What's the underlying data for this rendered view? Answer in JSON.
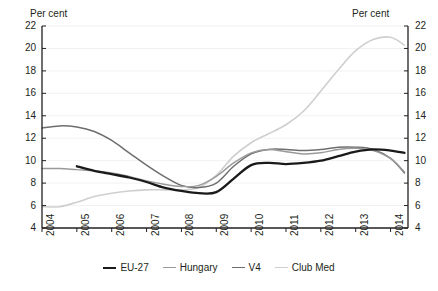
{
  "chart_data": {
    "type": "line",
    "title": "",
    "xlabel": "",
    "ylabel": "Per cent",
    "ylabel_right": "Per cent",
    "ylim": [
      4,
      22
    ],
    "yticks": [
      4,
      6,
      8,
      10,
      12,
      14,
      16,
      18,
      20,
      22
    ],
    "ytick_labels": [
      "4",
      "6",
      "8",
      "10",
      "12",
      "14",
      "16",
      "18",
      "20",
      "22"
    ],
    "xlim": [
      2004,
      2014.5
    ],
    "xticks": [
      2004,
      2005,
      2006,
      2007,
      2008,
      2009,
      2010,
      2011,
      2012,
      2013,
      2014
    ],
    "xtick_labels": [
      "2004",
      "2005",
      "2006",
      "2007",
      "2008",
      "2009",
      "2010",
      "2011",
      "2012",
      "2013",
      "2014"
    ],
    "grid": true,
    "grid_color": "#f2f2f2",
    "legend_position": "bottom",
    "series": [
      {
        "name": "EU-27",
        "color": "#1a1a1a",
        "width": 2.3,
        "x": [
          2005.0,
          2005.5,
          2006.0,
          2006.5,
          2007.0,
          2007.5,
          2008.0,
          2008.5,
          2009.0,
          2009.5,
          2010.0,
          2010.5,
          2011.0,
          2011.5,
          2012.0,
          2012.5,
          2013.0,
          2013.5,
          2014.0,
          2014.4
        ],
        "values": [
          9.5,
          9.1,
          8.8,
          8.5,
          8.1,
          7.6,
          7.3,
          7.1,
          7.2,
          8.4,
          9.6,
          9.8,
          9.7,
          9.8,
          10.0,
          10.4,
          10.8,
          11.0,
          10.9,
          10.7
        ]
      },
      {
        "name": "Hungary",
        "color": "#9a9a9a",
        "width": 1.4,
        "x": [
          2004.0,
          2004.5,
          2005.0,
          2005.5,
          2006.0,
          2006.5,
          2007.0,
          2007.5,
          2008.0,
          2008.5,
          2009.0,
          2009.5,
          2010.0,
          2010.5,
          2011.0,
          2011.5,
          2012.0,
          2012.5,
          2013.0,
          2013.5,
          2014.0,
          2014.4
        ],
        "values": [
          9.3,
          9.3,
          9.2,
          9.1,
          8.9,
          8.6,
          8.2,
          7.9,
          7.7,
          7.8,
          8.6,
          9.8,
          10.7,
          11.0,
          10.8,
          10.6,
          10.7,
          11.0,
          11.1,
          10.9,
          10.2,
          9.0
        ]
      },
      {
        "name": "V4",
        "color": "#6e6e6e",
        "width": 1.5,
        "x": [
          2004.0,
          2004.5,
          2005.0,
          2005.5,
          2006.0,
          2006.5,
          2007.0,
          2007.5,
          2008.0,
          2008.5,
          2009.0,
          2009.5,
          2010.0,
          2010.5,
          2011.0,
          2011.5,
          2012.0,
          2012.5,
          2013.0,
          2013.5,
          2014.0,
          2014.4
        ],
        "values": [
          12.9,
          13.1,
          13.0,
          12.6,
          11.8,
          10.7,
          9.6,
          8.6,
          7.8,
          7.6,
          8.0,
          9.5,
          10.6,
          11.0,
          11.0,
          10.9,
          11.0,
          11.2,
          11.2,
          11.0,
          10.2,
          8.9
        ]
      },
      {
        "name": "Club Med",
        "color": "#cfcfcf",
        "width": 1.6,
        "x": [
          2004.0,
          2004.5,
          2005.0,
          2005.5,
          2006.0,
          2006.5,
          2007.0,
          2007.5,
          2008.0,
          2008.5,
          2009.0,
          2009.5,
          2010.0,
          2010.5,
          2011.0,
          2011.5,
          2012.0,
          2012.5,
          2013.0,
          2013.5,
          2014.0,
          2014.4
        ],
        "values": [
          5.9,
          5.9,
          6.3,
          6.8,
          7.1,
          7.3,
          7.4,
          7.4,
          7.4,
          7.6,
          8.7,
          10.4,
          11.6,
          12.4,
          13.2,
          14.4,
          16.2,
          18.1,
          19.8,
          20.8,
          21.0,
          20.3
        ]
      }
    ]
  },
  "legend": [
    {
      "label": "EU-27"
    },
    {
      "label": "Hungary"
    },
    {
      "label": "V4"
    },
    {
      "label": "Club Med"
    }
  ]
}
